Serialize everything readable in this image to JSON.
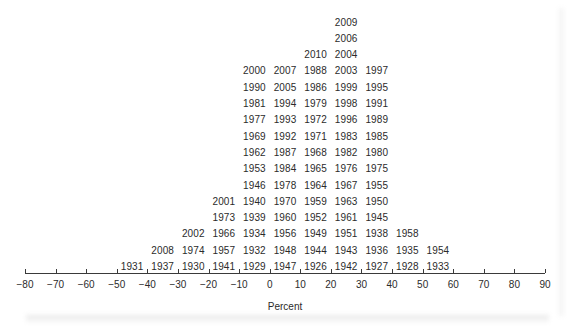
{
  "chart_data": {
    "type": "bar",
    "title": "",
    "subtitle": "",
    "xlabel": "Percent",
    "ylabel": "",
    "xlim": [
      -80,
      90
    ],
    "ylim": [
      0,
      18
    ],
    "grid": false,
    "legend": null,
    "bin_width": 10,
    "note": "Stacked-label dot plot (stem-style histogram): each year is plotted as a text label stacked in its percent bin.",
    "axis": {
      "ticks": [
        -80,
        -70,
        -60,
        -50,
        -40,
        -30,
        -20,
        -10,
        0,
        10,
        20,
        30,
        40,
        50,
        60,
        70,
        80,
        90
      ],
      "tick_labels": [
        "−80",
        "−70",
        "−60",
        "−50",
        "−40",
        "−30",
        "−20",
        "−10",
        "0",
        "10",
        "20",
        "30",
        "40",
        "50",
        "60",
        "70",
        "80",
        "90"
      ]
    },
    "categories": [
      "-55",
      "-45",
      "-35",
      "-25",
      "-15",
      "-5",
      "5",
      "15",
      "25",
      "35",
      "45",
      "55"
    ],
    "values": [
      3,
      4,
      6,
      14,
      15,
      16,
      16,
      16,
      18,
      14,
      4,
      3
    ],
    "bins": [
      {
        "center": -55,
        "range": [
          -60,
          -50
        ],
        "count": 3,
        "years": [
          "1931",
          "2008",
          "2002"
        ]
      },
      {
        "center": -45,
        "range": [
          -50,
          -40
        ],
        "count": 4,
        "years": [
          "1937",
          "1974",
          "1966",
          "2001"
        ]
      },
      {
        "center": -35,
        "range": [
          -40,
          -30
        ],
        "count": 6,
        "years": [
          "1930",
          "1957",
          "1934",
          "1939",
          "1940",
          "1973"
        ]
      },
      {
        "center": -25,
        "range": [
          -30,
          -20
        ],
        "count": 14,
        "years": [
          "1941",
          "1932",
          "1956",
          "1960",
          "1970",
          "1978",
          "1984",
          "1987",
          "1992",
          "1993",
          "1994",
          "2005",
          "2007",
          "2000"
        ]
      },
      {
        "center": -15,
        "range": [
          -20,
          -10
        ],
        "count": 15,
        "years": [
          "1929",
          "1948",
          "1949",
          "1952",
          "1959",
          "1964",
          "1965",
          "1968",
          "1971",
          "1972",
          "1979",
          "1986",
          "1988",
          "2010",
          "1990"
        ]
      },
      {
        "center": -5,
        "range": [
          -10,
          0
        ],
        "count": 16,
        "years": [
          "1947",
          "1944",
          "1951",
          "1961",
          "1963",
          "1967",
          "1976",
          "1982",
          "1983",
          "1996",
          "1998",
          "1999",
          "2003",
          "2004",
          "2006",
          "2009"
        ]
      },
      {
        "center": 5,
        "range": [
          0,
          10
        ],
        "count": 16,
        "years": [
          "1926",
          "1943",
          "1938",
          "1945",
          "1950",
          "1955",
          "1975",
          "1980",
          "1985",
          "1989",
          "1991",
          "1995",
          "1997",
          "1981",
          "1977",
          "1969"
        ]
      },
      {
        "center": 15,
        "range": [
          10,
          20
        ],
        "count": 16,
        "years": [
          "1942",
          "1936",
          "1958",
          "1962",
          "1953",
          "1946",
          "1992",
          "1987",
          "1984",
          "1978"
        ]
      },
      {
        "center": 25,
        "range": [
          20,
          30
        ],
        "count": 18,
        "years": [
          "1927",
          "1935"
        ]
      },
      {
        "center": 35,
        "range": [
          30,
          40
        ],
        "count": 14,
        "years": [
          "1928",
          "1954"
        ]
      },
      {
        "center": 45,
        "range": [
          40,
          50
        ],
        "count": 4,
        "years": [
          "1933"
        ]
      },
      {
        "center": 55,
        "range": [
          50,
          60
        ],
        "count": 3,
        "years": []
      }
    ],
    "rows": [
      {
        "row": 17,
        "cells": [
          {
            "col": 25,
            "year": "2009"
          }
        ]
      },
      {
        "row": 16,
        "cells": [
          {
            "col": 25,
            "year": "2006"
          }
        ]
      },
      {
        "row": 15,
        "cells": [
          {
            "col": 15,
            "year": "2010"
          },
          {
            "col": 25,
            "year": "2004"
          }
        ]
      },
      {
        "row": 14,
        "cells": [
          {
            "col": -5,
            "year": "2000"
          },
          {
            "col": 5,
            "year": "2007"
          },
          {
            "col": 15,
            "year": "1988"
          },
          {
            "col": 25,
            "year": "2003"
          },
          {
            "col": 35,
            "year": "1997"
          }
        ]
      },
      {
        "row": 13,
        "cells": [
          {
            "col": -5,
            "year": "1990"
          },
          {
            "col": 5,
            "year": "2005"
          },
          {
            "col": 15,
            "year": "1986"
          },
          {
            "col": 25,
            "year": "1999"
          },
          {
            "col": 35,
            "year": "1995"
          }
        ]
      },
      {
        "row": 12,
        "cells": [
          {
            "col": -5,
            "year": "1981"
          },
          {
            "col": 5,
            "year": "1994"
          },
          {
            "col": 15,
            "year": "1979"
          },
          {
            "col": 25,
            "year": "1998"
          },
          {
            "col": 35,
            "year": "1991"
          }
        ]
      },
      {
        "row": 11,
        "cells": [
          {
            "col": -5,
            "year": "1977"
          },
          {
            "col": 5,
            "year": "1993"
          },
          {
            "col": 15,
            "year": "1972"
          },
          {
            "col": 25,
            "year": "1996"
          },
          {
            "col": 35,
            "year": "1989"
          }
        ]
      },
      {
        "row": 10,
        "cells": [
          {
            "col": -5,
            "year": "1969"
          },
          {
            "col": 5,
            "year": "1992"
          },
          {
            "col": 15,
            "year": "1971"
          },
          {
            "col": 25,
            "year": "1983"
          },
          {
            "col": 35,
            "year": "1985"
          }
        ]
      },
      {
        "row": 9,
        "cells": [
          {
            "col": -5,
            "year": "1962"
          },
          {
            "col": 5,
            "year": "1987"
          },
          {
            "col": 15,
            "year": "1968"
          },
          {
            "col": 25,
            "year": "1982"
          },
          {
            "col": 35,
            "year": "1980"
          }
        ]
      },
      {
        "row": 8,
        "cells": [
          {
            "col": -5,
            "year": "1953"
          },
          {
            "col": 5,
            "year": "1984"
          },
          {
            "col": 15,
            "year": "1965"
          },
          {
            "col": 25,
            "year": "1976"
          },
          {
            "col": 35,
            "year": "1975"
          }
        ]
      },
      {
        "row": 7,
        "cells": [
          {
            "col": -5,
            "year": "1946"
          },
          {
            "col": 5,
            "year": "1978"
          },
          {
            "col": 15,
            "year": "1964"
          },
          {
            "col": 25,
            "year": "1967"
          },
          {
            "col": 35,
            "year": "1955"
          }
        ]
      },
      {
        "row": 6,
        "cells": [
          {
            "col": -15,
            "year": "2001"
          },
          {
            "col": -5,
            "year": "1940"
          },
          {
            "col": 5,
            "year": "1970"
          },
          {
            "col": 15,
            "year": "1959"
          },
          {
            "col": 25,
            "year": "1963"
          },
          {
            "col": 35,
            "year": "1950"
          }
        ]
      },
      {
        "row": 5,
        "cells": [
          {
            "col": -15,
            "year": "1973"
          },
          {
            "col": -5,
            "year": "1939"
          },
          {
            "col": 5,
            "year": "1960"
          },
          {
            "col": 15,
            "year": "1952"
          },
          {
            "col": 25,
            "year": "1961"
          },
          {
            "col": 35,
            "year": "1945"
          }
        ]
      },
      {
        "row": 4,
        "cells": [
          {
            "col": -25,
            "year": "2002"
          },
          {
            "col": -15,
            "year": "1966"
          },
          {
            "col": -5,
            "year": "1934"
          },
          {
            "col": 5,
            "year": "1956"
          },
          {
            "col": 15,
            "year": "1949"
          },
          {
            "col": 25,
            "year": "1951"
          },
          {
            "col": 35,
            "year": "1938"
          },
          {
            "col": 45,
            "year": "1958"
          }
        ]
      },
      {
        "row": 3,
        "cells": [
          {
            "col": -35,
            "year": "2008"
          },
          {
            "col": -25,
            "year": "1974"
          },
          {
            "col": -15,
            "year": "1957"
          },
          {
            "col": -5,
            "year": "1932"
          },
          {
            "col": 5,
            "year": "1948"
          },
          {
            "col": 15,
            "year": "1944"
          },
          {
            "col": 25,
            "year": "1943"
          },
          {
            "col": 35,
            "year": "1936"
          },
          {
            "col": 45,
            "year": "1935"
          },
          {
            "col": 55,
            "year": "1954"
          }
        ]
      },
      {
        "row": 2,
        "cells": [
          {
            "col": -45,
            "year": "1931"
          },
          {
            "col": -35,
            "year": "1937"
          },
          {
            "col": -25,
            "year": "1930"
          },
          {
            "col": -15,
            "year": "1941"
          },
          {
            "col": -5,
            "year": "1929"
          },
          {
            "col": 5,
            "year": "1947"
          },
          {
            "col": 15,
            "year": "1926"
          },
          {
            "col": 25,
            "year": "1942"
          },
          {
            "col": 35,
            "year": "1927"
          },
          {
            "col": 45,
            "year": "1928"
          },
          {
            "col": 55,
            "year": "1933"
          }
        ]
      }
    ]
  },
  "colors": {
    "text": "#2b2b2b",
    "axis": "#3a3a3a",
    "background": "#ffffff"
  }
}
